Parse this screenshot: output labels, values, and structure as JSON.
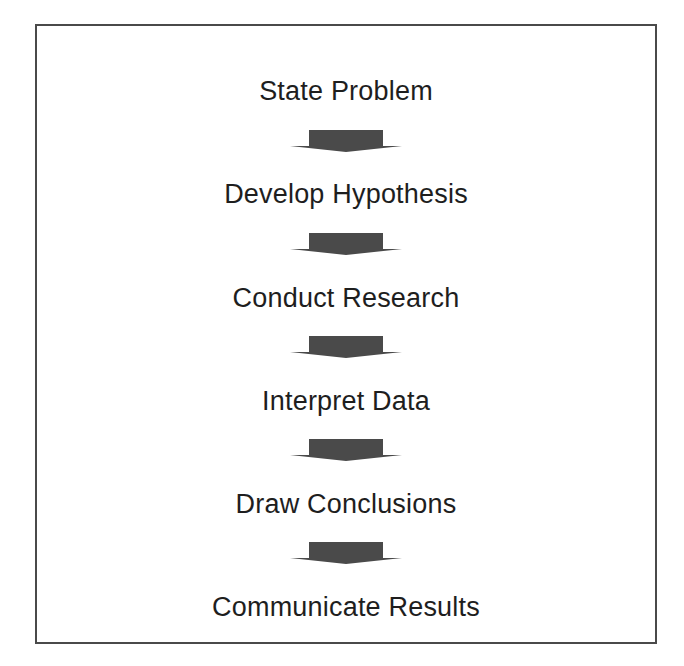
{
  "diagram": {
    "type": "vertical-flowchart",
    "title": "",
    "steps": [
      {
        "label": "State Problem"
      },
      {
        "label": "Develop Hypothesis"
      },
      {
        "label": "Conduct Research"
      },
      {
        "label": "Interpret Data"
      },
      {
        "label": "Draw Conclusions"
      },
      {
        "label": "Communicate Results"
      }
    ],
    "connector": {
      "icon": "down-arrow-icon",
      "color": "#4a4a4a"
    },
    "border_color": "#4a4a4a",
    "text_color": "#1e1e1e"
  }
}
